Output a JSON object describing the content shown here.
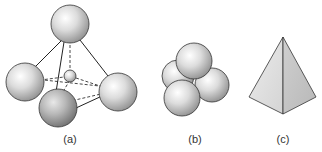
{
  "figure": {
    "panels": [
      {
        "id": "a",
        "label": "(a)",
        "description": "Four large spheres at tetrahedron vertices with a small sphere in the tetrahedral hole"
      },
      {
        "id": "b",
        "label": "(b)",
        "description": "Four spheres packed in contact forming a tetrahedral cluster"
      },
      {
        "id": "c",
        "label": "(c)",
        "description": "Tetrahedron solid shape"
      }
    ]
  },
  "colors": {
    "sphere_light": "#f2f2f2",
    "sphere_mid": "#c8c8c8",
    "sphere_dark": "#8a8a8a",
    "outline": "#333333",
    "face_left": "#e2e2e2",
    "face_right": "#c9c9c9"
  }
}
